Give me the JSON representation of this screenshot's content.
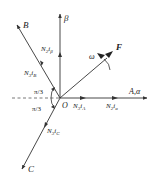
{
  "diagram": {
    "type": "phasor/vector diagram",
    "origin_label": "O",
    "axes": {
      "beta": {
        "label": "β"
      },
      "alpha": {
        "label": "A,α"
      },
      "B": {
        "label": "B"
      },
      "C": {
        "label": "C"
      }
    },
    "vectors": {
      "F": {
        "label": "F"
      },
      "omega": {
        "label": "ω"
      }
    },
    "currents": {
      "i_beta": {
        "coef": "N",
        "sub1": "2",
        "i": "i",
        "sub2": "β"
      },
      "i_B": {
        "coef": "N",
        "sub1": "3",
        "i": "i",
        "sub2": "B"
      },
      "i_A": {
        "coef": "N",
        "sub1": "3",
        "i": "i",
        "sub2": "A"
      },
      "i_alpha": {
        "coef": "N",
        "sub1": "2",
        "i": "i",
        "sub2": "α"
      },
      "i_C": {
        "coef": "N",
        "sub1": "3",
        "i": "i",
        "sub2": "C"
      }
    },
    "angles": {
      "upper": "π/3",
      "lower": "π/3"
    },
    "colors": {
      "line": "#333333",
      "text": "#222222"
    }
  }
}
